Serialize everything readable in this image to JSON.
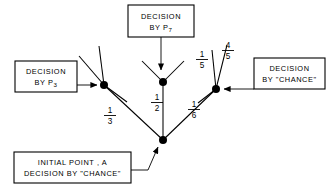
{
  "figure": {
    "title_present": false,
    "background_color": "#ffffff",
    "ink_color": "#000000"
  },
  "boxes": {
    "p7": {
      "id": "decision-by-p7",
      "line1": "DECISION",
      "line2_prefix": "BY  P",
      "line2_subscript": "7",
      "x": 128,
      "y": 5,
      "w": 66,
      "h": 32
    },
    "p3": {
      "id": "decision-by-p3",
      "line1": "DECISION",
      "line2_prefix": "BY  P",
      "line2_subscript": "3",
      "x": 15,
      "y": 61,
      "w": 62,
      "h": 31
    },
    "chance_right": {
      "id": "decision-by-chance-right",
      "line1": "DECISION",
      "line2": "BY \"CHANCE\"",
      "x": 254,
      "y": 58,
      "w": 71,
      "h": 31
    },
    "initial": {
      "id": "initial-point-a",
      "line1": "INITIAL  POINT , A",
      "line2": "DECISION BY \"CHANCE\"",
      "x": 14,
      "y": 152,
      "w": 117,
      "h": 31
    }
  },
  "nodes": [
    {
      "id": "initial-point",
      "label": "A",
      "x": 163,
      "y": 140,
      "r": 4.0,
      "type": "chance"
    },
    {
      "id": "node-left-p3",
      "label": "P3",
      "x": 104,
      "y": 85,
      "r": 4.0,
      "type": "player"
    },
    {
      "id": "node-center-p7",
      "label": "P7",
      "x": 163,
      "y": 82,
      "r": 4.0,
      "type": "player"
    },
    {
      "id": "node-right-chance",
      "label": "CHANCE",
      "x": 216,
      "y": 89,
      "r": 4.0,
      "type": "chance"
    }
  ],
  "edges": [
    {
      "id": "edge-initial-to-left",
      "from": "initial-point",
      "to": "node-left-p3",
      "label_num": "1",
      "label_den": "3",
      "label_x": 110,
      "label_y": 117
    },
    {
      "id": "edge-initial-to-center",
      "from": "initial-point",
      "to": "node-center-p7",
      "label_num": "1",
      "label_den": "2",
      "label_x": 157,
      "label_y": 103
    },
    {
      "id": "edge-initial-to-right",
      "from": "initial-point",
      "to": "node-right-chance",
      "label_num": "1",
      "label_den": "6",
      "label_x": 192,
      "label_y": 111
    }
  ],
  "branch_labels": [
    {
      "id": "branch-label-1-5",
      "num": "1",
      "den": "5",
      "x": 202,
      "y": 58
    },
    {
      "id": "branch-label-4-5",
      "num": "4",
      "den": "5",
      "x": 228,
      "y": 50
    }
  ],
  "sub_branches": {
    "left_node": [
      {
        "id": "left-branch-up-outer",
        "x2": 83,
        "y2": 51
      },
      {
        "id": "left-branch-up-inner",
        "x2": 99,
        "y2": 47
      },
      {
        "id": "left-branch-down-right",
        "x2": 124,
        "y2": 98
      }
    ],
    "center_node": [
      {
        "id": "center-branch-up-left",
        "x2": 143,
        "y2": 62
      },
      {
        "id": "center-branch-up-right",
        "x2": 183,
        "y2": 62
      }
    ],
    "right_node": [
      {
        "id": "right-branch-up-left",
        "x2": 213,
        "y2": 51
      },
      {
        "id": "right-branch-up-right",
        "x2": 226,
        "y2": 46
      },
      {
        "id": "right-branch-down-left",
        "x2": 199,
        "y2": 101
      }
    ]
  },
  "leaders": [
    {
      "id": "leader-p7-arrow",
      "description": "arrow from P7 box down to center node"
    },
    {
      "id": "leader-p3-arrow",
      "description": "arrow from P3 box right to left node"
    },
    {
      "id": "leader-chance-arrow",
      "description": "arrow from right chance box left to right node"
    },
    {
      "id": "leader-initial-arrow",
      "description": "arrow from initial point box up-right to initial node"
    }
  ]
}
